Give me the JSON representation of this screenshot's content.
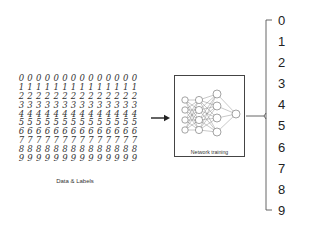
{
  "input": {
    "caption": "Data & Labels",
    "rows": [
      {
        "digit": "0",
        "samples": [
          "0",
          "0",
          "0",
          "0",
          "0",
          "0",
          "0",
          "0",
          "0",
          "0",
          "0",
          "0",
          "0",
          "0"
        ]
      },
      {
        "digit": "1",
        "samples": [
          "1",
          "1",
          "1",
          "1",
          "1",
          "1",
          "1",
          "1",
          "1",
          "1",
          "1",
          "1",
          "1",
          "1"
        ]
      },
      {
        "digit": "2",
        "samples": [
          "2",
          "2",
          "2",
          "2",
          "2",
          "2",
          "2",
          "2",
          "2",
          "2",
          "2",
          "2",
          "2",
          "2"
        ]
      },
      {
        "digit": "3",
        "samples": [
          "3",
          "3",
          "3",
          "3",
          "3",
          "3",
          "3",
          "3",
          "3",
          "3",
          "3",
          "3",
          "3",
          "3"
        ]
      },
      {
        "digit": "4",
        "samples": [
          "4",
          "4",
          "4",
          "4",
          "4",
          "4",
          "4",
          "4",
          "4",
          "4",
          "4",
          "4",
          "4",
          "4"
        ]
      },
      {
        "digit": "5",
        "samples": [
          "5",
          "5",
          "5",
          "5",
          "5",
          "5",
          "5",
          "5",
          "5",
          "5",
          "5",
          "5",
          "5",
          "5"
        ]
      },
      {
        "digit": "6",
        "samples": [
          "6",
          "6",
          "6",
          "6",
          "6",
          "6",
          "6",
          "6",
          "6",
          "6",
          "6",
          "6",
          "6",
          "6"
        ]
      },
      {
        "digit": "7",
        "samples": [
          "7",
          "7",
          "7",
          "7",
          "7",
          "7",
          "7",
          "7",
          "7",
          "7",
          "7",
          "7",
          "7",
          "7"
        ]
      },
      {
        "digit": "8",
        "samples": [
          "8",
          "8",
          "8",
          "8",
          "8",
          "8",
          "8",
          "8",
          "8",
          "8",
          "8",
          "8",
          "8",
          "8"
        ]
      },
      {
        "digit": "9",
        "samples": [
          "9",
          "9",
          "9",
          "9",
          "9",
          "9",
          "9",
          "9",
          "9",
          "9",
          "9",
          "9",
          "9",
          "9"
        ]
      }
    ]
  },
  "arrow": {
    "icon": "right-arrow-icon"
  },
  "model": {
    "label": "Network training",
    "icon": "neural-network-icon"
  },
  "output": {
    "classes": [
      "0",
      "1",
      "2",
      "3",
      "4",
      "5",
      "6",
      "7",
      "8",
      "9"
    ]
  },
  "colors": {
    "stroke": "#444444",
    "text": "#222222",
    "background": "#ffffff"
  }
}
